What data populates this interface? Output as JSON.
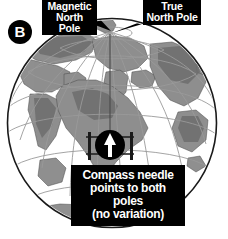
{
  "figure": {
    "panel_letter": "B",
    "labels": {
      "magnetic_pole": "Magnetic\nNorth Pole",
      "true_pole": "True\nNorth Pole"
    },
    "caption": "Compass needle\npoints to both\npoles\n(no variation)",
    "icons": {
      "compass": "compass-needle-icon",
      "globe": "globe-icon"
    },
    "colors": {
      "label_background": "#000000",
      "label_text": "#ffffff",
      "ocean": "#ffffff",
      "land": "#8f8f8f",
      "land_dark": "#6e6e6e",
      "grid_line": "#9a9a9a",
      "globe_outline": "#1a1a1a",
      "compass_body": "#000000",
      "compass_needle": "#ffffff",
      "page_background": "#ffffff"
    },
    "geometry": {
      "globe_center_x": 112,
      "globe_center_y": 123,
      "globe_radius": 105,
      "pole_x": 110,
      "pole_y": 32,
      "compass_x": 110,
      "compass_y": 145,
      "compass_radius": 15
    }
  }
}
